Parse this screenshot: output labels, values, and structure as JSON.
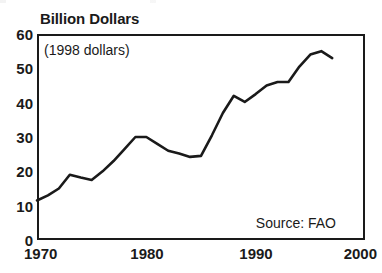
{
  "chart_data": {
    "type": "line",
    "title": "",
    "ylabel": "Billion Dollars",
    "xlabel": "",
    "annotation": "(1998 dollars)",
    "source": "Source: FAO",
    "xlim": [
      1970,
      2000
    ],
    "ylim": [
      0,
      60
    ],
    "grid": false,
    "legend": "none",
    "xticks": [
      "1970",
      "1980",
      "1990",
      "2000"
    ],
    "xtick_values": [
      1970,
      1980,
      1990,
      2000
    ],
    "yticks": [
      "0",
      "10",
      "20",
      "30",
      "40",
      "50",
      "60"
    ],
    "ytick_values": [
      0,
      10,
      20,
      30,
      40,
      50,
      60
    ],
    "series": [
      {
        "name": "World Fish Exports",
        "x": [
          1970,
          1971,
          1972,
          1973,
          1974,
          1975,
          1976,
          1977,
          1978,
          1979,
          1980,
          1981,
          1982,
          1983,
          1984,
          1985,
          1986,
          1987,
          1988,
          1989,
          1990,
          1991,
          1992,
          1993,
          1994,
          1995,
          1996,
          1997
        ],
        "values": [
          11.5,
          13.0,
          15.0,
          19.0,
          18.2,
          17.5,
          20.0,
          23.0,
          26.5,
          30.0,
          30.0,
          28.0,
          26.0,
          25.2,
          24.2,
          24.5,
          30.5,
          37.0,
          42.0,
          40.2,
          42.5,
          45.0,
          46.0,
          46.0,
          50.5,
          54.0,
          55.0,
          53.0
        ]
      }
    ]
  },
  "figure": {
    "axis_title": "Billion Dollars",
    "annotation": "(1998 dollars)",
    "source": "Source: FAO"
  }
}
